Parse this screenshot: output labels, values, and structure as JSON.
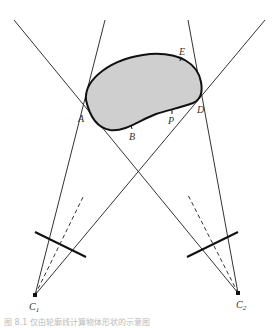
{
  "labels": {
    "A": "A",
    "B": "B",
    "D": "D",
    "E": "E",
    "P": "P",
    "C1_main": "C",
    "C1_sub": "1",
    "C2_main": "C",
    "C2_sub": "2"
  },
  "colors": {
    "stroke": "#222222",
    "blob_fill": "#cfcfcf",
    "blob_stroke": "#111111",
    "background": "#ffffff"
  },
  "caption": "图 8.1 仅由轮廓线计算物体形状的示意图"
}
